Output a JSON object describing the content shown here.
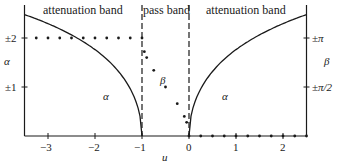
{
  "chart_data": {
    "type": "line",
    "title": "",
    "regions": [
      {
        "name": "attenuation band",
        "u_range": [
          -3.5,
          -1
        ]
      },
      {
        "name": "pass band",
        "u_range": [
          -1,
          0
        ]
      },
      {
        "name": "attenuation band",
        "u_range": [
          0,
          2.5
        ]
      }
    ],
    "xlabel": "u",
    "ylabel_left": "α",
    "ylabel_right": "β",
    "xlim": [
      -3.5,
      2.5
    ],
    "ylim": [
      0,
      2.5
    ],
    "x_ticks": [
      -3,
      -2,
      -1,
      1,
      2,
      0
    ],
    "x_tick_labels": [
      "−3",
      "−2",
      "−1",
      "1",
      "2",
      "0"
    ],
    "left_y_ticks": [
      {
        "value": 2,
        "label": "±2"
      },
      {
        "value": 1,
        "label": "±1"
      }
    ],
    "right_y_ticks": [
      {
        "value": 2,
        "label": "±π"
      },
      {
        "value": 1,
        "label": "±π/2"
      }
    ],
    "dashed_verticals": [
      -1,
      0
    ],
    "series": [
      {
        "name": "α",
        "style": "solid-line",
        "formula": "α = 2·arcsinh(√(−1−u)) for u<−1; 2·arcsinh(√u) for u>0",
        "x": [
          -3.5,
          -3,
          -2.5,
          -2,
          -1.5,
          -1,
          0,
          0.5,
          1,
          1.5,
          2,
          2.5
        ],
        "values": [
          2.49,
          2.29,
          2.06,
          1.76,
          1.32,
          0,
          0,
          1.32,
          1.76,
          2.06,
          2.29,
          2.49
        ]
      },
      {
        "name": "β",
        "style": "dots",
        "formula": "β = π for u<−1; 2·arcsin(√(−u)) in pass band; 0 for u>0",
        "x": [
          -3.25,
          -3,
          -2.75,
          -2.5,
          -2.25,
          -2,
          -1.75,
          -1.5,
          -1.25,
          -1,
          -0.95,
          -0.9,
          -0.75,
          -0.5,
          -0.25,
          -0.1,
          -0.05,
          0,
          0.25,
          0.5,
          0.75,
          1,
          1.25,
          1.5,
          1.75,
          2,
          2.25,
          2.5
        ],
        "values_in_pi_units": [
          1,
          1,
          1,
          1,
          1,
          1,
          1,
          1,
          1,
          1,
          0.86,
          0.8,
          0.67,
          0.5,
          0.33,
          0.2,
          0.14,
          0,
          0,
          0,
          0,
          0,
          0,
          0,
          0,
          0,
          0,
          0
        ]
      }
    ],
    "annotations": [
      {
        "text": "α",
        "near": "left curve"
      },
      {
        "text": "β",
        "near": "pass-band dots"
      },
      {
        "text": "α",
        "near": "right curve"
      }
    ],
    "grid": false,
    "legend": "none"
  },
  "labels": {
    "band_left": "attenuation band",
    "band_mid": "pass band",
    "band_right": "attenuation band",
    "alpha_axis": "α",
    "beta_axis": "β",
    "alpha_left_curve": "α",
    "beta_dots": "β",
    "alpha_right_curve": "α",
    "u_axis": "u",
    "tick_pm2": "±2",
    "tick_pm1": "±1",
    "tick_pi": "±π",
    "tick_pi2": "±π/2",
    "tick_m3": "−3",
    "tick_m2": "−2",
    "tick_m1": "−1",
    "tick_0": "0",
    "tick_1": "1",
    "tick_2": "2"
  }
}
